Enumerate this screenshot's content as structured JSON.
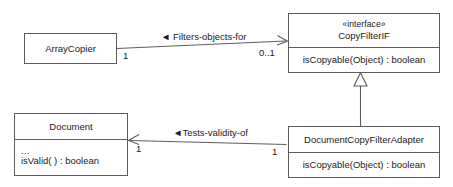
{
  "diagram": {
    "kind": "uml-class-diagram",
    "background_color": "#ffffff",
    "line_color": "#5d5d5d",
    "text_color": "#1b1b1b",
    "classes": [
      {
        "id": "array-copier",
        "name": "ArrayCopier",
        "stereotype": "",
        "members": []
      },
      {
        "id": "copy-filter-if",
        "name": "CopyFilterIF",
        "stereotype": "«interface»",
        "members": [
          "isCopyable(Object) : boolean"
        ]
      },
      {
        "id": "document",
        "name": "Document",
        "stereotype": "",
        "members": [
          "...",
          "isValid( ) : boolean"
        ]
      },
      {
        "id": "document-copy-filter-adapter",
        "name": "DocumentCopyFilterAdapter",
        "stereotype": "",
        "members": [
          "isCopyable(Object) : boolean"
        ]
      }
    ],
    "associations": [
      {
        "id": "filters-objects-for",
        "label": "◄ Filters-objects-for",
        "source": "ArrayCopier",
        "target": "CopyFilterIF",
        "source_multiplicity": "1",
        "target_multiplicity": "0..1",
        "arrow": "open"
      },
      {
        "id": "tests-validity-of",
        "label": "◄Tests-validity-of",
        "source": "DocumentCopyFilterAdapter",
        "target": "Document",
        "source_multiplicity": "1",
        "target_multiplicity": "1",
        "arrow": "open"
      }
    ],
    "generalizations": [
      {
        "id": "adapter-implements-interface",
        "source": "DocumentCopyFilterAdapter",
        "target": "CopyFilterIF",
        "arrow": "hollow-triangle"
      }
    ]
  }
}
